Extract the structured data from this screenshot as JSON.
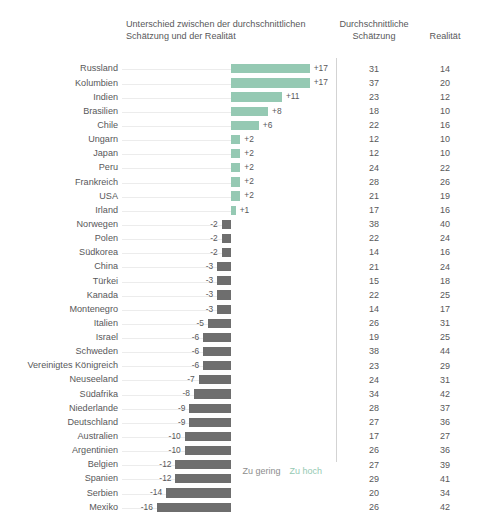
{
  "header": {
    "diff_title": "Unterschied zwischen der durchschnittlichen Schätzung und der Realität",
    "estimate_title": "Durchschnittliche Schätzung",
    "reality_title": "Realität"
  },
  "legend": {
    "too_low": "Zu gering",
    "too_high": "Zu hoch"
  },
  "colors": {
    "positive": "#95c9b3",
    "negative": "#6e6e6e",
    "text": "#58585a",
    "guide": "#ececec",
    "divider": "#d3d3d3"
  },
  "chart_data": {
    "type": "bar",
    "title": "Unterschied zwischen der durchschnittlichen Schätzung und der Realität",
    "xlabel": "",
    "ylabel": "",
    "orientation": "horizontal",
    "baseline": 0,
    "xlim": [
      -16,
      17
    ],
    "grid": false,
    "legend_position": "bottom-right",
    "legend": [
      "Zu gering",
      "Zu hoch"
    ],
    "columns": [
      "Land",
      "Unterschied",
      "Durchschnittliche Schätzung",
      "Realität"
    ],
    "categories": [
      "Russland",
      "Kolumbien",
      "Indien",
      "Brasilien",
      "Chile",
      "Ungarn",
      "Japan",
      "Peru",
      "Frankreich",
      "USA",
      "Irland",
      "Norwegen",
      "Polen",
      "Südkorea",
      "China",
      "Türkei",
      "Kanada",
      "Montenegro",
      "Italien",
      "Israel",
      "Schweden",
      "Vereinigtes Königreich",
      "Neuseeland",
      "Südafrika",
      "Niederlande",
      "Deutschland",
      "Australien",
      "Argentinien",
      "Belgien",
      "Spanien",
      "Serbien",
      "Mexiko"
    ],
    "values": [
      17,
      17,
      11,
      8,
      6,
      2,
      2,
      2,
      2,
      2,
      1,
      -2,
      -2,
      -2,
      -3,
      -3,
      -3,
      -3,
      -5,
      -6,
      -6,
      -6,
      -7,
      -8,
      -9,
      -9,
      -10,
      -10,
      -12,
      -12,
      -14,
      -16
    ],
    "series": [
      {
        "name": "Durchschnittliche Schätzung",
        "values": [
          31,
          37,
          23,
          18,
          22,
          12,
          12,
          24,
          28,
          21,
          17,
          38,
          22,
          14,
          21,
          15,
          22,
          14,
          26,
          19,
          38,
          23,
          24,
          34,
          28,
          27,
          17,
          26,
          27,
          29,
          20,
          26
        ]
      },
      {
        "name": "Realität",
        "values": [
          14,
          20,
          12,
          10,
          16,
          10,
          10,
          22,
          26,
          19,
          16,
          40,
          24,
          16,
          24,
          18,
          25,
          17,
          31,
          25,
          44,
          29,
          31,
          42,
          37,
          36,
          27,
          36,
          39,
          41,
          34,
          42
        ]
      }
    ],
    "rows": [
      {
        "label": "Russland",
        "diff": 17,
        "diff_label": "+17",
        "estimate": 31,
        "reality": 14
      },
      {
        "label": "Kolumbien",
        "diff": 17,
        "diff_label": "+17",
        "estimate": 37,
        "reality": 20
      },
      {
        "label": "Indien",
        "diff": 11,
        "diff_label": "+11",
        "estimate": 23,
        "reality": 12
      },
      {
        "label": "Brasilien",
        "diff": 8,
        "diff_label": "+8",
        "estimate": 18,
        "reality": 10
      },
      {
        "label": "Chile",
        "diff": 6,
        "diff_label": "+6",
        "estimate": 22,
        "reality": 16
      },
      {
        "label": "Ungarn",
        "diff": 2,
        "diff_label": "+2",
        "estimate": 12,
        "reality": 10
      },
      {
        "label": "Japan",
        "diff": 2,
        "diff_label": "+2",
        "estimate": 12,
        "reality": 10
      },
      {
        "label": "Peru",
        "diff": 2,
        "diff_label": "+2",
        "estimate": 24,
        "reality": 22
      },
      {
        "label": "Frankreich",
        "diff": 2,
        "diff_label": "+2",
        "estimate": 28,
        "reality": 26
      },
      {
        "label": "USA",
        "diff": 2,
        "diff_label": "+2",
        "estimate": 21,
        "reality": 19
      },
      {
        "label": "Irland",
        "diff": 1,
        "diff_label": "+1",
        "estimate": 17,
        "reality": 16
      },
      {
        "label": "Norwegen",
        "diff": -2,
        "diff_label": "-2",
        "estimate": 38,
        "reality": 40
      },
      {
        "label": "Polen",
        "diff": -2,
        "diff_label": "-2",
        "estimate": 22,
        "reality": 24
      },
      {
        "label": "Südkorea",
        "diff": -2,
        "diff_label": "-2",
        "estimate": 14,
        "reality": 16
      },
      {
        "label": "China",
        "diff": -3,
        "diff_label": "-3",
        "estimate": 21,
        "reality": 24
      },
      {
        "label": "Türkei",
        "diff": -3,
        "diff_label": "-3",
        "estimate": 15,
        "reality": 18
      },
      {
        "label": "Kanada",
        "diff": -3,
        "diff_label": "-3",
        "estimate": 22,
        "reality": 25
      },
      {
        "label": "Montenegro",
        "diff": -3,
        "diff_label": "-3",
        "estimate": 14,
        "reality": 17
      },
      {
        "label": "Italien",
        "diff": -5,
        "diff_label": "-5",
        "estimate": 26,
        "reality": 31
      },
      {
        "label": "Israel",
        "diff": -6,
        "diff_label": "-6",
        "estimate": 19,
        "reality": 25
      },
      {
        "label": "Schweden",
        "diff": -6,
        "diff_label": "-6",
        "estimate": 38,
        "reality": 44
      },
      {
        "label": "Vereinigtes Königreich",
        "diff": -6,
        "diff_label": "-6",
        "estimate": 23,
        "reality": 29
      },
      {
        "label": "Neuseeland",
        "diff": -7,
        "diff_label": "-7",
        "estimate": 24,
        "reality": 31
      },
      {
        "label": "Südafrika",
        "diff": -8,
        "diff_label": "-8",
        "estimate": 34,
        "reality": 42
      },
      {
        "label": "Niederlande",
        "diff": -9,
        "diff_label": "-9",
        "estimate": 28,
        "reality": 37
      },
      {
        "label": "Deutschland",
        "diff": -9,
        "diff_label": "-9",
        "estimate": 27,
        "reality": 36
      },
      {
        "label": "Australien",
        "diff": -10,
        "diff_label": "-10",
        "estimate": 17,
        "reality": 27
      },
      {
        "label": "Argentinien",
        "diff": -10,
        "diff_label": "-10",
        "estimate": 26,
        "reality": 36
      },
      {
        "label": "Belgien",
        "diff": -12,
        "diff_label": "-12",
        "estimate": 27,
        "reality": 39
      },
      {
        "label": "Spanien",
        "diff": -12,
        "diff_label": "-12",
        "estimate": 29,
        "reality": 41
      },
      {
        "label": "Serbien",
        "diff": -14,
        "diff_label": "-14",
        "estimate": 20,
        "reality": 34
      },
      {
        "label": "Mexiko",
        "diff": -16,
        "diff_label": "-16",
        "estimate": 26,
        "reality": 42
      }
    ]
  }
}
